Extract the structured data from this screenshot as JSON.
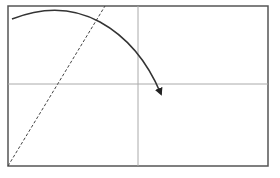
{
  "diagram": {
    "frame": {
      "x": 8,
      "y": 6,
      "width": 260,
      "height": 160,
      "stroke": "#555555"
    },
    "crosshair": {
      "vx": 138,
      "hy": 84,
      "stroke": "#aaaaaa"
    },
    "dashed_line": {
      "x1": 8,
      "y1": 166,
      "x2": 105,
      "y2": 6,
      "stroke": "#444444"
    },
    "curve": {
      "path": "M12,19 Q60,0 100,22 Q140,44 161,94",
      "stroke": "#333333"
    },
    "arrow_color": "#222222"
  }
}
